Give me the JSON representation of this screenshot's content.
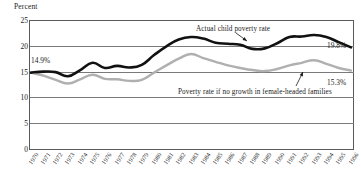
{
  "chart_data": {
    "type": "line",
    "title": "",
    "subtitle": "",
    "xlabel": "",
    "ylabel": "Percent",
    "ylim": [
      0,
      25
    ],
    "yticks": [
      0,
      5,
      10,
      15,
      20,
      25
    ],
    "grid": true,
    "legend_position": "inline-annotations",
    "x": [
      1970,
      1971,
      1972,
      1973,
      1974,
      1975,
      1976,
      1977,
      1978,
      1979,
      1980,
      1981,
      1982,
      1983,
      1984,
      1985,
      1986,
      1987,
      1988,
      1989,
      1990,
      1991,
      1992,
      1993,
      1994,
      1995,
      1996
    ],
    "categories": [
      "1970",
      "1971",
      "1972",
      "1973",
      "1974",
      "1975",
      "1976",
      "1977",
      "1978",
      "1979",
      "1980",
      "1981",
      "1982",
      "1983",
      "1984",
      "1985",
      "1986",
      "1987",
      "1988",
      "1989",
      "1990",
      "1991",
      "1992",
      "1993",
      "1994",
      "1995",
      "1996"
    ],
    "series": [
      {
        "name": "Actual child poverty rate",
        "color": "#111111",
        "values": [
          14.9,
          15.1,
          15.0,
          14.2,
          15.4,
          16.8,
          15.8,
          16.2,
          15.9,
          16.4,
          18.3,
          20.0,
          21.3,
          21.8,
          21.5,
          20.7,
          20.5,
          20.3,
          19.5,
          19.6,
          20.6,
          21.8,
          21.9,
          22.2,
          21.8,
          20.8,
          19.8
        ]
      },
      {
        "name": "Poverty rate if no growth in female-headed families",
        "color": "#b0b0b0",
        "values": [
          14.9,
          14.3,
          13.5,
          12.8,
          13.6,
          14.5,
          13.7,
          13.6,
          13.3,
          13.5,
          14.9,
          16.3,
          17.6,
          18.5,
          17.7,
          17.0,
          16.3,
          15.8,
          15.4,
          15.2,
          15.6,
          16.3,
          16.8,
          17.3,
          16.6,
          15.8,
          15.3
        ]
      }
    ],
    "annotations": [
      {
        "name": "actual-series-label",
        "text": "Actual child poverty rate"
      },
      {
        "name": "counterfactual-series-label",
        "text": "Poverty rate if no growth in female-headed families"
      }
    ],
    "data_labels": [
      {
        "name": "start-value",
        "text": "14.9%"
      },
      {
        "name": "actual-end-value",
        "text": "19.8%"
      },
      {
        "name": "counterfactual-end-value",
        "text": "15.3%"
      }
    ]
  },
  "axis": {
    "y_title": "Percent",
    "y_tick_labels": [
      "25",
      "20",
      "15",
      "10",
      "5",
      "0"
    ]
  },
  "colors": {
    "actual_line": "#111111",
    "counterfactual_line": "#b0b0b0",
    "grid": "#7a7a7a",
    "frame": "#5a5a5a",
    "background": "#ffffff"
  }
}
